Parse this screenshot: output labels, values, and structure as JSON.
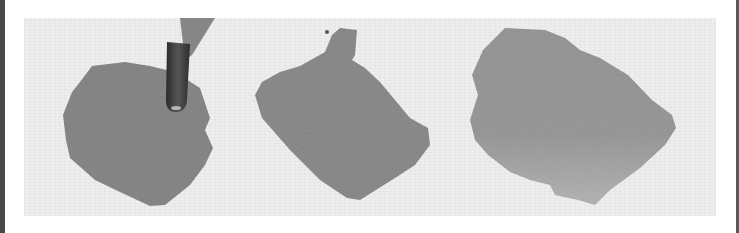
{
  "image": {
    "description": "Three grayscale watercolor swatches on textured paper with a paintbrush tip touching the first swatch",
    "caption": "Watercolor swatches",
    "colors": {
      "paper": "#eeeeee",
      "swatch_1": "#8c8c8c",
      "swatch_2": "#8f8f8f",
      "swatch_3": "#a0a0a0",
      "brush": "#3a3a3a",
      "frame": "#4a4a4a"
    },
    "swatches": [
      {
        "label": "Textured granulating wash"
      },
      {
        "label": "Flat even wash"
      },
      {
        "label": "Graded wash"
      }
    ]
  }
}
